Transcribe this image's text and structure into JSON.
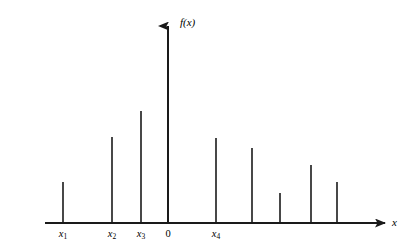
{
  "figure": {
    "axis_color": "#1a1a1a",
    "stem_color": "#1a1a1a",
    "background": "#ffffff",
    "y_axis_label": "f(x)",
    "x_axis_label": "x"
  },
  "labels": {
    "x1": "x",
    "x1_sub": "1",
    "x2": "x",
    "x2_sub": "2",
    "x3": "x",
    "x3_sub": "3",
    "origin": "0",
    "x4": "x",
    "x4_sub": "4"
  },
  "chart_data": {
    "type": "bar",
    "title": "",
    "xlabel": "x",
    "ylabel": "f(x)",
    "grid": false,
    "legend": null,
    "axis_origin_px": {
      "x": 168,
      "y": 223
    },
    "xlim_px": [
      45,
      388
    ],
    "ylim_px": [
      223,
      18
    ],
    "categories": [
      "x1",
      "x2",
      "x3",
      "x5",
      "x4",
      "x6",
      "x7",
      "x8",
      "x9"
    ],
    "tick_labels": [
      "x₁",
      "x₂",
      "x₃",
      "0",
      "x₄"
    ],
    "points": [
      {
        "label": "x1",
        "x_px": 63,
        "top_px": 182,
        "height_px": 41,
        "value": 0.2
      },
      {
        "label": "x2",
        "x_px": 112,
        "top_px": 137,
        "height_px": 86,
        "value": 0.42
      },
      {
        "label": "x3",
        "x_px": 141,
        "top_px": 111,
        "height_px": 112,
        "value": 0.55
      },
      {
        "label": "x5",
        "x_px": 168,
        "top_px": 18,
        "height_px": 205,
        "value": 1.0
      },
      {
        "label": "x4",
        "x_px": 216,
        "top_px": 138,
        "height_px": 85,
        "value": 0.41
      },
      {
        "label": "x6",
        "x_px": 252,
        "top_px": 148,
        "height_px": 75,
        "value": 0.37
      },
      {
        "label": "x7",
        "x_px": 280,
        "top_px": 193,
        "height_px": 30,
        "value": 0.15
      },
      {
        "label": "x8",
        "x_px": 311,
        "top_px": 165,
        "height_px": 58,
        "value": 0.28
      },
      {
        "label": "x9",
        "x_px": 337,
        "top_px": 182,
        "height_px": 41,
        "value": 0.2
      }
    ],
    "values": [
      0.2,
      0.42,
      0.55,
      1.0,
      0.41,
      0.37,
      0.15,
      0.28,
      0.2
    ]
  }
}
